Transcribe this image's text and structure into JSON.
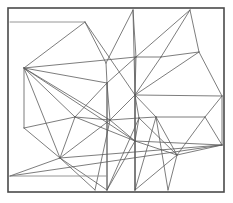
{
  "figure": {
    "width": 233,
    "height": 203,
    "background_color": "#ffffff"
  },
  "frame": {
    "name": "outer-rectangle-border",
    "x": 8,
    "y": 8,
    "width": 216,
    "height": 184,
    "stroke_color": "#4a4a4a",
    "stroke_width": 1.6,
    "fill": "#ffffff"
  },
  "style": {
    "line_color": "#5c5c5c",
    "line_width": 0.8,
    "reference_line_color": "#8a8a8a",
    "reference_line_width": 0.9
  },
  "chart_data": {
    "type": "line",
    "subtitle": "",
    "xlabel": "",
    "ylabel": "",
    "xlim": [
      0,
      233
    ],
    "ylim": [
      0,
      203
    ],
    "grid": false,
    "legend": "none",
    "annotations": [],
    "reference_lines": [
      {
        "name": "upper-horizontal-rule",
        "x1": 10,
        "y1": 22,
        "x2": 85,
        "y2": 22
      },
      {
        "name": "lower-horizontal-rule",
        "x1": 10,
        "y1": 176,
        "x2": 107,
        "y2": 176
      }
    ],
    "vertices": [
      {
        "id": "v0",
        "x": 24,
        "y": 68
      },
      {
        "id": "v1",
        "x": 85,
        "y": 22
      },
      {
        "id": "v2",
        "x": 133,
        "y": 10
      },
      {
        "id": "v3",
        "x": 190,
        "y": 10
      },
      {
        "id": "v4",
        "x": 199,
        "y": 52
      },
      {
        "id": "v5",
        "x": 136,
        "y": 57
      },
      {
        "id": "v6",
        "x": 106,
        "y": 63
      },
      {
        "id": "v7",
        "x": 161,
        "y": 57
      },
      {
        "id": "v8",
        "x": 222,
        "y": 96
      },
      {
        "id": "v9",
        "x": 135,
        "y": 95
      },
      {
        "id": "v10",
        "x": 107,
        "y": 83
      },
      {
        "id": "v11",
        "x": 75,
        "y": 117
      },
      {
        "id": "v12",
        "x": 110,
        "y": 120
      },
      {
        "id": "v13",
        "x": 139,
        "y": 118
      },
      {
        "id": "v14",
        "x": 205,
        "y": 117
      },
      {
        "id": "v15",
        "x": 156,
        "y": 117
      },
      {
        "id": "v16",
        "x": 222,
        "y": 145
      },
      {
        "id": "v17",
        "x": 177,
        "y": 155
      },
      {
        "id": "v18",
        "x": 60,
        "y": 158
      },
      {
        "id": "v19",
        "x": 135,
        "y": 141
      },
      {
        "id": "v20",
        "x": 10,
        "y": 176
      },
      {
        "id": "v21",
        "x": 107,
        "y": 190
      },
      {
        "id": "v22",
        "x": 135,
        "y": 190
      },
      {
        "id": "v23",
        "x": 24,
        "y": 128
      },
      {
        "id": "v24",
        "x": 168,
        "y": 190
      },
      {
        "id": "v25",
        "x": 10,
        "y": 22
      },
      {
        "id": "v26",
        "x": 95,
        "y": 190
      }
    ],
    "edges": [
      {
        "from": "v25",
        "to": "v1",
        "kind": "reference"
      },
      {
        "from": "v20",
        "to": "v21",
        "kind": "reference"
      },
      {
        "from": "v1",
        "to": "v9",
        "kind": "mesh"
      },
      {
        "from": "v1",
        "to": "v6",
        "kind": "mesh"
      },
      {
        "from": "v2",
        "to": "v6",
        "kind": "mesh"
      },
      {
        "from": "v2",
        "to": "v9",
        "kind": "mesh"
      },
      {
        "from": "v2",
        "to": "v5",
        "kind": "mesh"
      },
      {
        "from": "v3",
        "to": "v5",
        "kind": "mesh"
      },
      {
        "from": "v3",
        "to": "v7",
        "kind": "mesh"
      },
      {
        "from": "v3",
        "to": "v4",
        "kind": "mesh"
      },
      {
        "from": "v0",
        "to": "v1",
        "kind": "mesh"
      },
      {
        "from": "v0",
        "to": "v5",
        "kind": "mesh"
      },
      {
        "from": "v0",
        "to": "v10",
        "kind": "mesh"
      },
      {
        "from": "v0",
        "to": "v11",
        "kind": "mesh"
      },
      {
        "from": "v0",
        "to": "v12",
        "kind": "mesh"
      },
      {
        "from": "v0",
        "to": "v18",
        "kind": "mesh"
      },
      {
        "from": "v0",
        "to": "v23",
        "kind": "mesh"
      },
      {
        "from": "v0",
        "to": "v19",
        "kind": "mesh"
      },
      {
        "from": "v5",
        "to": "v7",
        "kind": "mesh"
      },
      {
        "from": "v5",
        "to": "v9",
        "kind": "mesh"
      },
      {
        "from": "v5",
        "to": "v10",
        "kind": "mesh"
      },
      {
        "from": "v6",
        "to": "v10",
        "kind": "mesh"
      },
      {
        "from": "v7",
        "to": "v4",
        "kind": "mesh"
      },
      {
        "from": "v7",
        "to": "v9",
        "kind": "mesh"
      },
      {
        "from": "v4",
        "to": "v8",
        "kind": "mesh"
      },
      {
        "from": "v4",
        "to": "v9",
        "kind": "mesh"
      },
      {
        "from": "v9",
        "to": "v8",
        "kind": "mesh"
      },
      {
        "from": "v9",
        "to": "v12",
        "kind": "mesh"
      },
      {
        "from": "v9",
        "to": "v13",
        "kind": "mesh"
      },
      {
        "from": "v9",
        "to": "v15",
        "kind": "mesh"
      },
      {
        "from": "v9",
        "to": "v19",
        "kind": "mesh"
      },
      {
        "from": "v9",
        "to": "v22",
        "kind": "mesh"
      },
      {
        "from": "v10",
        "to": "v11",
        "kind": "mesh"
      },
      {
        "from": "v10",
        "to": "v12",
        "kind": "mesh"
      },
      {
        "from": "v10",
        "to": "v21",
        "kind": "mesh"
      },
      {
        "from": "v11",
        "to": "v12",
        "kind": "mesh"
      },
      {
        "from": "v11",
        "to": "v23",
        "kind": "mesh"
      },
      {
        "from": "v11",
        "to": "v18",
        "kind": "mesh"
      },
      {
        "from": "v11",
        "to": "v19",
        "kind": "mesh"
      },
      {
        "from": "v12",
        "to": "v13",
        "kind": "mesh"
      },
      {
        "from": "v12",
        "to": "v19",
        "kind": "mesh"
      },
      {
        "from": "v12",
        "to": "v18",
        "kind": "mesh"
      },
      {
        "from": "v13",
        "to": "v15",
        "kind": "mesh"
      },
      {
        "from": "v13",
        "to": "v19",
        "kind": "mesh"
      },
      {
        "from": "v13",
        "to": "v17",
        "kind": "mesh"
      },
      {
        "from": "v15",
        "to": "v14",
        "kind": "mesh"
      },
      {
        "from": "v15",
        "to": "v17",
        "kind": "mesh"
      },
      {
        "from": "v14",
        "to": "v8",
        "kind": "mesh"
      },
      {
        "from": "v14",
        "to": "v16",
        "kind": "mesh"
      },
      {
        "from": "v14",
        "to": "v17",
        "kind": "mesh"
      },
      {
        "from": "v8",
        "to": "v16",
        "kind": "mesh"
      },
      {
        "from": "v16",
        "to": "v17",
        "kind": "mesh"
      },
      {
        "from": "v16",
        "to": "v19",
        "kind": "mesh"
      },
      {
        "from": "v16",
        "to": "v18",
        "kind": "mesh"
      },
      {
        "from": "v17",
        "to": "v19",
        "kind": "mesh"
      },
      {
        "from": "v17",
        "to": "v24",
        "kind": "mesh"
      },
      {
        "from": "v17",
        "to": "v22",
        "kind": "mesh"
      },
      {
        "from": "v19",
        "to": "v22",
        "kind": "mesh"
      },
      {
        "from": "v19",
        "to": "v21",
        "kind": "mesh"
      },
      {
        "from": "v18",
        "to": "v20",
        "kind": "mesh"
      },
      {
        "from": "v18",
        "to": "v21",
        "kind": "mesh"
      },
      {
        "from": "v18",
        "to": "v26",
        "kind": "mesh"
      },
      {
        "from": "v23",
        "to": "v18",
        "kind": "mesh"
      },
      {
        "from": "v20",
        "to": "v16",
        "kind": "mesh"
      },
      {
        "from": "v21",
        "to": "v13",
        "kind": "mesh"
      },
      {
        "from": "v22",
        "to": "v15",
        "kind": "mesh"
      },
      {
        "from": "v24",
        "to": "v15",
        "kind": "mesh"
      },
      {
        "from": "v26",
        "to": "v12",
        "kind": "mesh"
      }
    ],
    "vertical_drops": [
      {
        "name": "drop-left",
        "x": 107,
        "y1": 83,
        "y2": 190
      },
      {
        "name": "drop-right",
        "x": 135,
        "y1": 57,
        "y2": 190
      }
    ]
  }
}
